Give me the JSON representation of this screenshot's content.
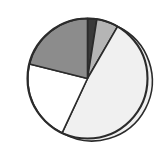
{
  "figure": {
    "background_color": "#ffffff",
    "outline_color": "#2b2b2b",
    "title": "",
    "width": 162,
    "height": 150
  },
  "geometry": {
    "center_x": 87.5,
    "center_y": 78.5,
    "radius": 60
  },
  "chart_data": {
    "type": "pie",
    "title": "",
    "subtitle": "",
    "xlabel": "",
    "ylabel": "",
    "legend": "none",
    "grid": false,
    "start_angle_deg": 0,
    "direction": "clockwise",
    "labels": [
      "Segment 1",
      "Segment 2",
      "Segment 3",
      "Segment 4",
      "Segment 5"
    ],
    "values": [
      2.5,
      6,
      48.5,
      22,
      21
    ],
    "percentages": [
      "2.5%",
      "6%",
      "48.5%",
      "22%",
      "21%"
    ],
    "colors": [
      "#3a3a3a",
      "#b5b5b5",
      "#f0f0f0",
      "#ffffff",
      "#8c8c8c"
    ],
    "slices": [
      {
        "label": "Segment 1",
        "value": 2.5,
        "percent": "2.5%",
        "color": "#3a3a3a",
        "shade": "near-black",
        "start_angle_deg": 0,
        "end_angle_deg": 9,
        "path": "M 87.5 78.5 L 87.5 18.5 A 60 60 0 0 1 96.89 19.24 Z"
      },
      {
        "label": "Segment 2",
        "value": 6,
        "percent": "6%",
        "color": "#b5b5b5",
        "shade": "light-gray",
        "start_angle_deg": 9,
        "end_angle_deg": 30,
        "path": "M 87.5 78.5 L 96.89 19.24 A 60 60 0 0 1 117.5 26.54 Z"
      },
      {
        "label": "Segment 3",
        "value": 48.5,
        "percent": "48.5%",
        "color": "#f0f0f0",
        "shade": "near-white",
        "start_angle_deg": 30,
        "end_angle_deg": 205,
        "path": "M 87.5 78.5 L 117.5 26.54 A 60 60 0 1 1 62.13 132.86 Z"
      },
      {
        "label": "Segment 4",
        "value": 22,
        "percent": "22%",
        "color": "#ffffff",
        "shade": "white",
        "start_angle_deg": 205,
        "end_angle_deg": 285,
        "path": "M 87.5 78.5 L 62.13 132.86 A 60 60 0 0 1 29.55 63.97 Z"
      },
      {
        "label": "Segment 5",
        "value": 21,
        "percent": "21%",
        "color": "#8c8c8c",
        "shade": "medium-gray",
        "start_angle_deg": 285,
        "end_angle_deg": 360,
        "path": "M 87.5 78.5 L 29.55 63.97 A 60 60 0 0 1 87.5 18.5 Z"
      }
    ]
  }
}
